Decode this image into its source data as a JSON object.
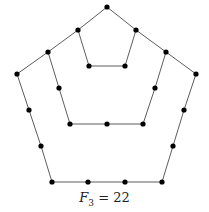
{
  "caption": {
    "var": "F",
    "sub": "3",
    "rest": " = 22"
  },
  "style": {
    "edge_color": "#333333",
    "node_color": "#000000",
    "node_radius": 2.6
  },
  "nodes": [
    [
      107,
      7
    ],
    [
      78,
      30
    ],
    [
      136,
      30
    ],
    [
      48,
      52
    ],
    [
      166,
      52
    ],
    [
      17,
      74
    ],
    [
      196,
      74
    ],
    [
      89,
      66
    ],
    [
      125,
      66
    ],
    [
      59,
      88
    ],
    [
      155,
      88
    ],
    [
      29,
      110
    ],
    [
      184,
      110
    ],
    [
      70,
      124
    ],
    [
      107,
      124
    ],
    [
      143,
      124
    ],
    [
      41,
      146
    ],
    [
      173,
      146
    ],
    [
      52,
      182
    ],
    [
      88,
      182
    ],
    [
      125,
      182
    ],
    [
      162,
      182
    ]
  ],
  "paths": [
    [
      [
        107,
        7
      ],
      [
        136,
        30
      ],
      [
        166,
        52
      ],
      [
        196,
        74
      ],
      [
        184,
        110
      ],
      [
        173,
        146
      ],
      [
        162,
        182
      ],
      [
        52,
        182
      ],
      [
        41,
        146
      ],
      [
        29,
        110
      ],
      [
        17,
        74
      ],
      [
        48,
        52
      ],
      [
        78,
        30
      ],
      [
        107,
        7
      ]
    ],
    [
      [
        78,
        30
      ],
      [
        89,
        66
      ],
      [
        125,
        66
      ],
      [
        136,
        30
      ]
    ],
    [
      [
        48,
        52
      ],
      [
        59,
        88
      ],
      [
        70,
        124
      ],
      [
        143,
        124
      ],
      [
        155,
        88
      ],
      [
        166,
        52
      ]
    ]
  ]
}
